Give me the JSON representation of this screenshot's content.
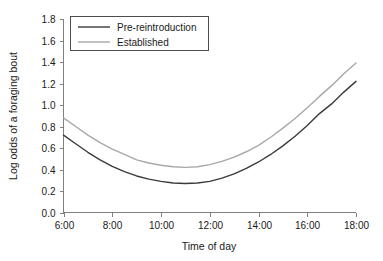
{
  "chart_data": {
    "type": "line",
    "title": "",
    "xlabel": "Time of day",
    "ylabel": "Log odds of a foraging bout",
    "xlim": [
      6,
      18
    ],
    "ylim": [
      0.0,
      1.8
    ],
    "grid": false,
    "legend_position": "top-left",
    "x_tick_labels": [
      "6:00",
      "8:00",
      "10:00",
      "12:00",
      "14:00",
      "16:00",
      "18:00"
    ],
    "x_ticks": [
      6,
      8,
      10,
      12,
      14,
      16,
      18
    ],
    "y_tick_labels": [
      "0.0",
      "0.2",
      "0.4",
      "0.6",
      "0.8",
      "1.0",
      "1.2",
      "1.4",
      "1.6",
      "1.8"
    ],
    "y_ticks": [
      0.0,
      0.2,
      0.4,
      0.6,
      0.8,
      1.0,
      1.2,
      1.4,
      1.6,
      1.8
    ],
    "x": [
      6,
      6.5,
      7,
      7.5,
      8,
      8.5,
      9,
      9.5,
      10,
      10.5,
      11,
      11.5,
      12,
      12.5,
      13,
      13.5,
      14,
      14.5,
      15,
      15.5,
      16,
      16.5,
      17,
      17.5,
      18
    ],
    "series": [
      {
        "name": "Pre-reintroduction",
        "color": "#3b3b3b",
        "values": [
          0.72,
          0.64,
          0.56,
          0.49,
          0.43,
          0.38,
          0.34,
          0.31,
          0.29,
          0.275,
          0.27,
          0.275,
          0.29,
          0.32,
          0.36,
          0.41,
          0.47,
          0.54,
          0.62,
          0.71,
          0.81,
          0.92,
          1.01,
          1.12,
          1.22
        ]
      },
      {
        "name": "Established",
        "color": "#a8a8a8",
        "values": [
          0.88,
          0.8,
          0.72,
          0.65,
          0.59,
          0.54,
          0.49,
          0.46,
          0.44,
          0.425,
          0.42,
          0.425,
          0.445,
          0.475,
          0.515,
          0.565,
          0.625,
          0.7,
          0.785,
          0.875,
          0.975,
          1.08,
          1.18,
          1.29,
          1.39
        ]
      }
    ]
  },
  "axes": {
    "y_axis_name": "Log odds of a foraging bout",
    "x_axis_name": "Time of day"
  },
  "legend": {
    "entries": [
      {
        "label": "Pre-reintroduction",
        "color": "#3b3b3b"
      },
      {
        "label": "Established",
        "color": "#a8a8a8"
      }
    ]
  }
}
